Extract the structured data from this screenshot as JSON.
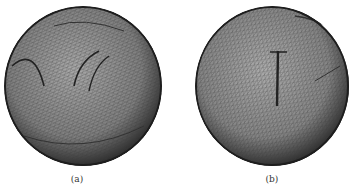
{
  "figure": {
    "panels": [
      {
        "id": "a",
        "caption": "(a)",
        "description": "wireframe triangulated sphere mesh with folded feature lines"
      },
      {
        "id": "b",
        "caption": "(b)",
        "description": "wireframe triangulated sphere mesh, smoother surface"
      }
    ],
    "colors": {
      "mesh_dark": "#2a2a2a",
      "mesh_mid": "#7a7a7a",
      "mesh_light": "#b8b8b8",
      "background": "#ffffff"
    }
  }
}
